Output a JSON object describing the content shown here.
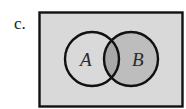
{
  "figure": {
    "label": "c.",
    "type": "venn-diagram",
    "sets": [
      {
        "name": "A",
        "cx": 92,
        "cy": 59,
        "r": 27,
        "shaded": false
      },
      {
        "name": "B",
        "cx": 131,
        "cy": 59,
        "r": 27,
        "shaded": true
      }
    ],
    "shaded_region": "B",
    "universe": {
      "x": 39,
      "y": 12,
      "width": 144,
      "height": 95
    },
    "colors": {
      "universe_fill": "#d9d9d9",
      "shaded_fill": "#bdbdbd",
      "intersection_fill": "#a8a8a8",
      "stroke": "#111111"
    }
  }
}
